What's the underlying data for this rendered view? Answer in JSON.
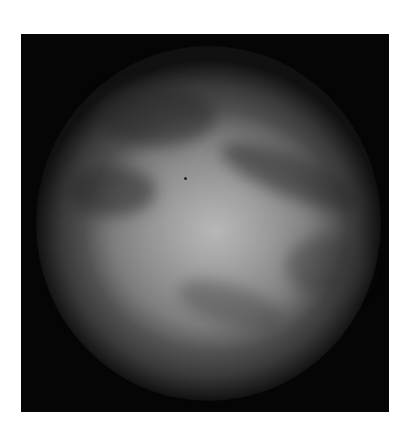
{
  "image": {
    "description": "Grayscale photograph of a planetary disc with dark bands on a black square background",
    "background_color": "#ffffff",
    "frame_color": "#050505",
    "disc_highlight_color": "#b9b9b9"
  }
}
